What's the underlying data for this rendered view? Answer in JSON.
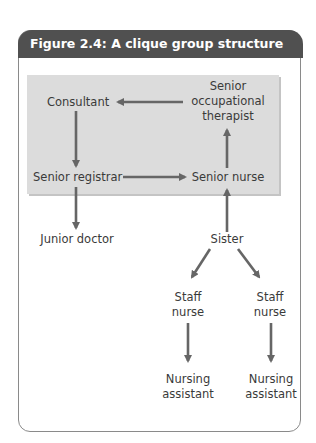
{
  "figure": {
    "title": "Figure 2.4: A clique group structure",
    "header_color": "#505050",
    "box_color": "#dcdcdc",
    "arrow_color": "#666666"
  },
  "nodes": {
    "consultant": "Consultant",
    "senior_ot_line1": "Senior",
    "senior_ot_line2": "occupational",
    "senior_ot_line3": "therapist",
    "senior_registrar": "Senior registrar",
    "senior_nurse": "Senior nurse",
    "junior_doctor": "Junior doctor",
    "sister": "Sister",
    "staff_nurse_1_line1": "Staff",
    "staff_nurse_1_line2": "nurse",
    "staff_nurse_2_line1": "Staff",
    "staff_nurse_2_line2": "nurse",
    "nursing_assistant_1_line1": "Nursing",
    "nursing_assistant_1_line2": "assistant",
    "nursing_assistant_2_line1": "Nursing",
    "nursing_assistant_2_line2": "assistant"
  },
  "edges": [
    {
      "from": "Senior occupational therapist",
      "to": "Consultant"
    },
    {
      "from": "Consultant",
      "to": "Senior registrar"
    },
    {
      "from": "Senior registrar",
      "to": "Senior nurse"
    },
    {
      "from": "Senior nurse",
      "to": "Senior occupational therapist"
    },
    {
      "from": "Senior registrar",
      "to": "Junior doctor"
    },
    {
      "from": "Sister",
      "to": "Senior nurse"
    },
    {
      "from": "Sister",
      "to": "Staff nurse (left)"
    },
    {
      "from": "Sister",
      "to": "Staff nurse (right)"
    },
    {
      "from": "Staff nurse (left)",
      "to": "Nursing assistant (left)"
    },
    {
      "from": "Staff nurse (right)",
      "to": "Nursing assistant (right)"
    }
  ]
}
